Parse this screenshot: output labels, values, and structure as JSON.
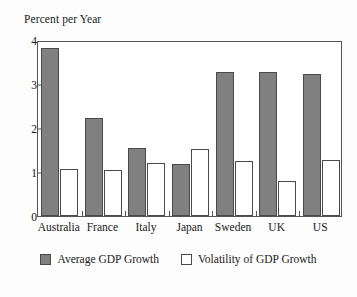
{
  "chart_data": {
    "type": "bar",
    "title": "",
    "ylabel": "Percent per Year",
    "xlabel": "",
    "ylim": [
      0,
      4
    ],
    "yticks": [
      0,
      1,
      2,
      3,
      4
    ],
    "ytick_labels": [
      "0",
      "1",
      "2",
      "3",
      "4"
    ],
    "grid": false,
    "legend_position": "bottom-center",
    "categories": [
      "Australia",
      "France",
      "Italy",
      "Japan",
      "Sweden",
      "UK",
      "US"
    ],
    "series": [
      {
        "name": "Average GDP Growth",
        "color": "#808080",
        "values": [
          3.82,
          2.23,
          1.55,
          1.18,
          3.28,
          3.27,
          3.22
        ]
      },
      {
        "name": "Volatility of GDP Growth",
        "color": "#ffffff",
        "values": [
          1.06,
          1.05,
          1.2,
          1.52,
          1.25,
          0.8,
          1.28
        ]
      }
    ]
  },
  "axis_title": "Percent per Year",
  "ghost_text": "",
  "legend": {
    "entries": [
      {
        "label": "Average GDP Growth"
      },
      {
        "label": "Volatility of GDP Growth"
      }
    ]
  }
}
